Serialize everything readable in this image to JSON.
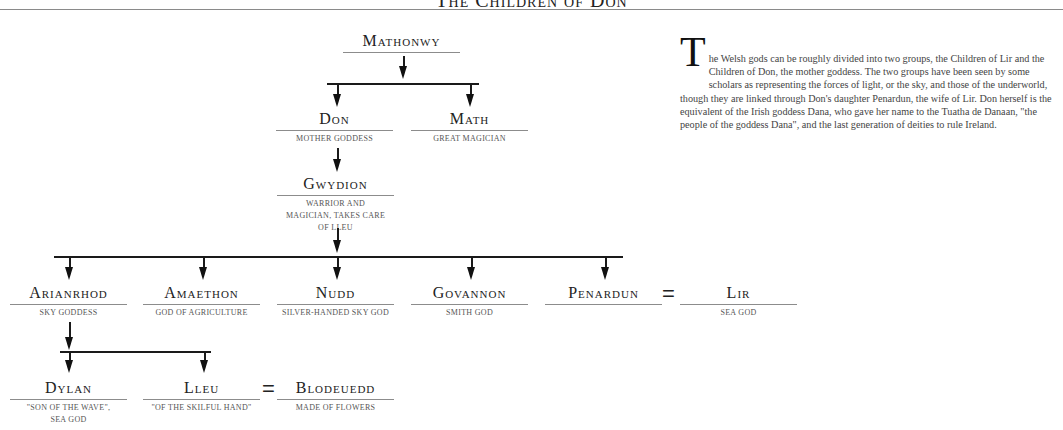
{
  "title": "The Children of Don",
  "nodes": {
    "mathonwy": {
      "name": "Mathonwy",
      "desc": ""
    },
    "don": {
      "name": "Don",
      "desc": "Mother Goddess"
    },
    "math": {
      "name": "Math",
      "desc": "Great Magician"
    },
    "gwydion": {
      "name": "Gwydion",
      "desc": "Warrior and Magician, Takes Care of Lleu"
    },
    "arianrhod": {
      "name": "Arianrhod",
      "desc": "Sky Goddess"
    },
    "amaethon": {
      "name": "Amaethon",
      "desc": "God of Agriculture"
    },
    "nudd": {
      "name": "Nudd",
      "desc": "Silver-Handed Sky God"
    },
    "govannon": {
      "name": "Govannon",
      "desc": "Smith God"
    },
    "penardun": {
      "name": "Penardun",
      "desc": ""
    },
    "lir": {
      "name": "Lir",
      "desc": "Sea God"
    },
    "dylan": {
      "name": "Dylan",
      "desc": "\"Son of the Wave\", Sea God"
    },
    "lleu": {
      "name": "Lleu",
      "desc": "\"Of the Skilful Hand\""
    },
    "blodeuedd": {
      "name": "Blodeuedd",
      "desc": "Made of Flowers"
    }
  },
  "marriage_symbol": "=",
  "description": {
    "dropcap": "T",
    "text": "he Welsh gods can be roughly divided into two groups, the Children of Lir and the Children of Don, the mother goddess. The two groups have been seen by some scholars as representing the forces of light, or the sky, and those of the underworld, though they are linked through Don's daughter Penardun, the wife of Lir. Don herself is the equivalent of the Irish goddess Dana, who gave her name to the Tuatha de Danaan, \"the people of the goddess Dana\", and the last generation of deities to rule Ireland."
  }
}
